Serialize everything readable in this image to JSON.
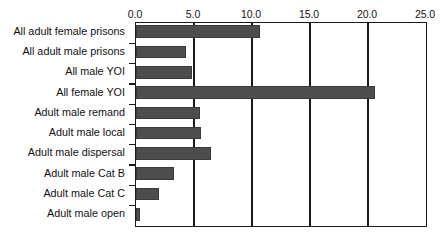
{
  "chart": {
    "type": "barh",
    "title": "",
    "xlabel": "",
    "ylabel": ""
  },
  "chart_data": {
    "type": "bar",
    "orientation": "horizontal",
    "title": "",
    "xlabel": "",
    "ylabel": "",
    "xlim": [
      0.0,
      25.0
    ],
    "xticks": [
      0.0,
      5.0,
      10.0,
      15.0,
      20.0,
      25.0
    ],
    "xtick_labels": [
      "0.0",
      "5.0",
      "10.0",
      "15.0",
      "20.0",
      "25.0"
    ],
    "xaxis_position": "top",
    "grid": "vertical-major",
    "legend": "none",
    "bar_color": "#4d4d4d",
    "categories": [
      "All adult female prisons",
      "All adult male prisons",
      "All male YOI",
      "All female YOI",
      "Adult male remand",
      "Adult male local",
      "Adult male dispersal",
      "Adult male Cat B",
      "Adult male Cat C",
      "Adult male open"
    ],
    "values": [
      10.7,
      4.3,
      4.8,
      20.6,
      5.5,
      5.6,
      6.5,
      3.3,
      2.0,
      0.35
    ]
  }
}
